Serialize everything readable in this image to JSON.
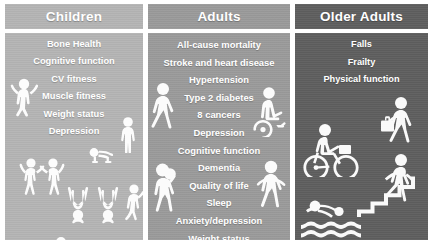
{
  "figure": {
    "type": "three-column-comparison-infographic",
    "background_color": "#ffffff"
  },
  "columns": [
    {
      "id": "children",
      "header": "Children",
      "header_color": "#b4b4b4",
      "panel_color": "#b4b4b4",
      "text_color": "#ffffff",
      "items": [
        "Bone Health",
        "Cognitive function",
        "CV fitness",
        "Muscle fitness",
        "Weight status",
        "Depression"
      ],
      "icons": [
        "child-jumping-icon",
        "child-standing-icon",
        "crawling-baby-icon",
        "two-children-highfive-icon",
        "child-handstand-left-icon",
        "child-handstand-right-icon",
        "child-climbing-icon",
        "child-lying-reading-icon"
      ]
    },
    {
      "id": "adults",
      "header": "Adults",
      "header_color": "#9a9a9a",
      "panel_color": "#9a9a9a",
      "text_color": "#ffffff",
      "items": [
        "All-cause mortality",
        "Stroke and heart disease",
        "Hypertension",
        "Type 2 diabetes",
        "8 cancers",
        "Depression",
        "Cognitive function",
        "Dementia",
        "Quality of life",
        "Sleep",
        "Anxiety/depression",
        "Weight status"
      ],
      "icons": [
        "walking-person-icon",
        "wheelchair-user-icon",
        "basketball-player-icon",
        "running-person-icon"
      ]
    },
    {
      "id": "older-adults",
      "header": "Older Adults",
      "header_color": "#5e5e5e",
      "panel_color": "#5e5e5e",
      "text_color": "#ffffff",
      "items": [
        "Falls",
        "Frailty",
        "Physical function"
      ],
      "icons": [
        "walking-with-bag-icon",
        "cyclist-icon",
        "stair-climbing-icon",
        "swimmer-icon"
      ]
    }
  ]
}
